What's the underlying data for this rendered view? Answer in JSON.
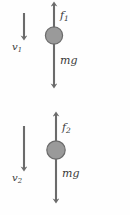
{
  "figure": {
    "type": "free-body-diagram",
    "background_color": "#fefefe",
    "stroke_color": "#6b6b6b",
    "disk_fill_color": "#9a9a9a",
    "disk_stroke_color": "#6b6b6b",
    "text_color": "#3a3a3a"
  },
  "systems": [
    {
      "name": "upper-system",
      "velocity": {
        "label_base": "v",
        "label_sub": "1",
        "direction": "down",
        "length_px": 26
      },
      "up_force": {
        "label_base": "f",
        "label_sub": "1",
        "direction": "up"
      },
      "down_force": {
        "label_base": "mg",
        "label_sub": "",
        "direction": "down"
      }
    },
    {
      "name": "lower-system",
      "velocity": {
        "label_base": "v",
        "label_sub": "2",
        "direction": "down",
        "length_px": 44
      },
      "up_force": {
        "label_base": "f",
        "label_sub": "2",
        "direction": "up"
      },
      "down_force": {
        "label_base": "mg",
        "label_sub": "",
        "direction": "down"
      }
    }
  ]
}
